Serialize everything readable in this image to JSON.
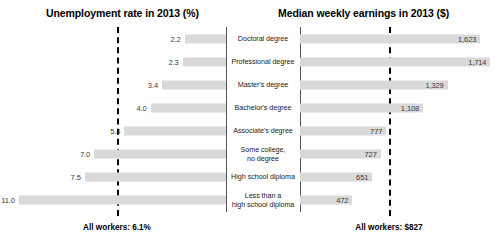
{
  "titles": {
    "left": "Unemployment rate in 2013 (%)",
    "right": "Median weekly earnings in 2013 ($)"
  },
  "footers": {
    "left": "All workers: 6.1%",
    "right": "All workers: $827"
  },
  "chart_data": {
    "type": "bar",
    "orientation": "horizontal-diverging",
    "categories": [
      "Doctoral degree",
      "Professional degree",
      "Master's degree",
      "Bachelor's degree",
      "Associate's degree",
      "Some college,\nno degree",
      "High school diploma",
      "Less than a\nhigh school diploma"
    ],
    "category_lines": [
      [
        "Doctoral degree"
      ],
      [
        "Professional degree"
      ],
      [
        "Master's degree"
      ],
      [
        "Bachelor's degree"
      ],
      [
        "Associate's degree"
      ],
      [
        "Some college,",
        "no degree"
      ],
      [
        "High school diploma"
      ],
      [
        "Less than a",
        "high school diploma"
      ]
    ],
    "series": [
      {
        "name": "Unemployment rate in 2013 (%)",
        "side": "left",
        "unit": "%",
        "values": [
          2.2,
          2.3,
          3.4,
          4.0,
          5.4,
          7.0,
          7.5,
          11.0
        ],
        "labels": [
          "2.2",
          "2.3",
          "3.4",
          "4.0",
          "5.4",
          "7.0",
          "7.5",
          "11.0"
        ],
        "axis_max": 12.0,
        "reference_line": {
          "value": 6.1,
          "label": "All workers: 6.1%"
        }
      },
      {
        "name": "Median weekly earnings in 2013 ($)",
        "side": "right",
        "unit": "$",
        "values": [
          1623,
          1714,
          1329,
          1108,
          777,
          727,
          651,
          472
        ],
        "labels": [
          "1,623",
          "1,714",
          "1,329",
          "1,108",
          "777",
          "727",
          "651",
          "472"
        ],
        "axis_max": 1800,
        "reference_line": {
          "value": 827,
          "label": "All workers: $827"
        }
      }
    ],
    "grid": false,
    "legend": "none",
    "colors": {
      "bar": "#d9d9d9",
      "axis": "#555555",
      "reference_line": "#000000",
      "value_text": "#3a3a3a",
      "title_text": "#000000"
    }
  }
}
